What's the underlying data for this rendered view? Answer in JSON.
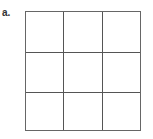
{
  "figure": {
    "label": "a.",
    "grid": {
      "rows": 3,
      "cols": 3,
      "line_color": "#555555"
    }
  }
}
